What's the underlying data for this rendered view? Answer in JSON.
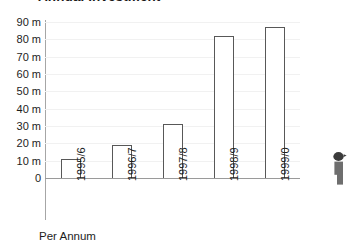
{
  "chart_data": {
    "type": "bar",
    "title": "Annual Investment",
    "xlabel": "Per Annum",
    "ylabel": "",
    "categories": [
      "1995/6",
      "1996/7",
      "1997/8",
      "1998/9",
      "1999/0"
    ],
    "values": [
      11,
      19,
      31,
      82,
      87
    ],
    "ytick_labels": [
      "90 m",
      "80 m",
      "70 m",
      "60 m",
      "50 m",
      "40 m",
      "30 m",
      "20 m",
      "10 m",
      "0"
    ],
    "ytick_values": [
      90,
      80,
      70,
      60,
      50,
      40,
      30,
      20,
      10,
      0
    ],
    "ylim": [
      0,
      90
    ],
    "grid": true,
    "grid_axis": "y",
    "legend": null,
    "legend_position": "none",
    "bar_style": {
      "fill": "#ffffff",
      "outline": "#585858"
    },
    "unit_suffix": "m"
  },
  "colors": {
    "background": "#ffffff",
    "text": "#1d1d1d",
    "gridline": "#f1f1f1",
    "axis": "#9a9a9a",
    "bar_outline": "#585858",
    "bar_fill": "#ffffff",
    "figure_icon": "#6e6e6e"
  },
  "icons": {
    "figure": "person-silhouette-icon"
  }
}
